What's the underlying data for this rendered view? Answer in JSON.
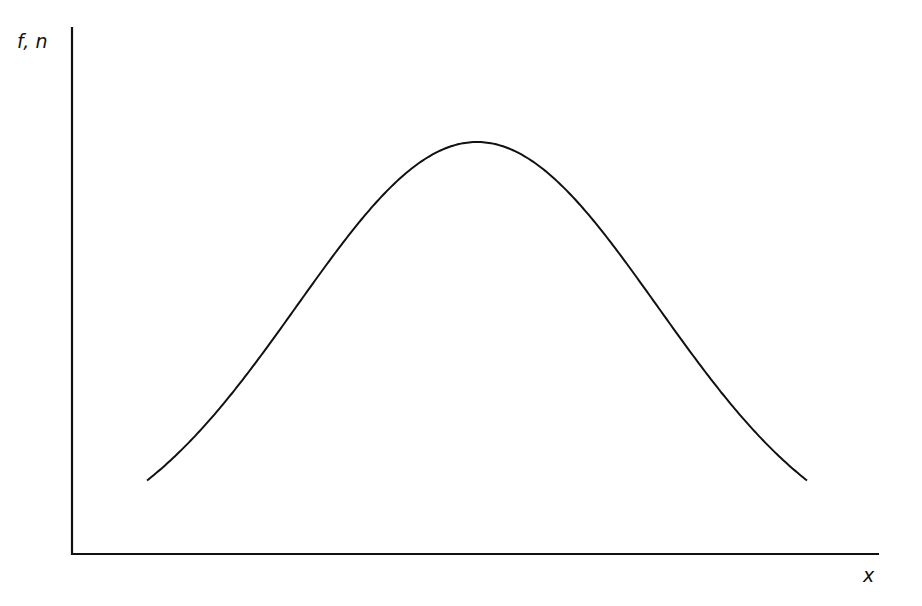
{
  "chart_data": {
    "type": "line",
    "title": "",
    "xlabel": "x",
    "ylabel": "f, n",
    "grid": false,
    "legend": null,
    "ticks": {
      "x": [],
      "y": []
    },
    "series": [
      {
        "name": "bell-shaped distribution",
        "shape": "gaussian",
        "description": "Symmetric bell curve; no numeric values shown on axes",
        "x_normalized": [
          0.0,
          0.1,
          0.2,
          0.3,
          0.4,
          0.5,
          0.6,
          0.7,
          0.8,
          0.9,
          1.0
        ],
        "y_normalized": [
          0.0,
          0.07,
          0.24,
          0.51,
          0.8,
          1.0,
          0.8,
          0.51,
          0.24,
          0.07,
          0.0
        ]
      }
    ]
  },
  "colors": {
    "line": "#111111",
    "axis": "#111111",
    "background": "#ffffff"
  },
  "layout": {
    "origin": [
      72,
      554
    ],
    "x_axis_end": 879,
    "y_axis_top": 27,
    "curve": {
      "x_start": 147,
      "x_end": 807,
      "center_x": 477,
      "peak_y": 142,
      "baseline_y": 558,
      "sigma_px": 180
    }
  }
}
